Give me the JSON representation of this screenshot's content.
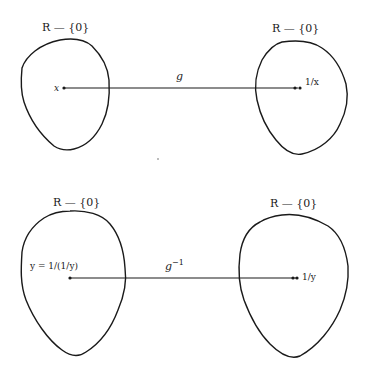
{
  "diagram": {
    "top": {
      "domain_label": "R — {0}",
      "codomain_label": "R — {0}",
      "map_label": "g",
      "source_point_label": "x",
      "target_point_label": "1/x"
    },
    "bottom": {
      "domain_label": "R — {0}",
      "codomain_label": "R — {0}",
      "map_label": "g",
      "map_superscript": "−1",
      "source_point_label": "y = 1/(1/y)",
      "target_point_label": "1/y"
    }
  }
}
